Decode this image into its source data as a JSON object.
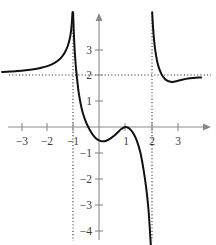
{
  "figure": {
    "title": "",
    "background_color": "#ffffff",
    "curve_color": "#111111",
    "axis_color": "#8a8a8a",
    "asymptote_color": "#2a2a2a",
    "label_color": "#3b3b3b"
  },
  "chart_data": {
    "type": "line",
    "title": "",
    "xlabel": "",
    "ylabel": "",
    "xlim": [
      -3.7,
      3.9
    ],
    "ylim": [
      -4.6,
      4.4
    ],
    "grid": false,
    "legend": null,
    "x_ticks": [
      -3,
      -2,
      -1,
      1,
      2,
      3
    ],
    "x_tick_labels": [
      "−3",
      "−2",
      "−1",
      "1",
      "2",
      "3"
    ],
    "y_ticks": [
      3,
      2,
      1,
      -1,
      -2,
      -3,
      -4
    ],
    "y_tick_labels": [
      "3",
      "2",
      "1",
      "−1",
      "−2",
      "−3",
      "−4"
    ],
    "asymptotes": {
      "vertical": [
        -1,
        2
      ],
      "horizontal": [
        2
      ]
    },
    "features": {
      "local_min_middle_branch": [
        0.15,
        -0.55
      ],
      "local_max_middle_branch": [
        1,
        0
      ],
      "local_min_right_branch": [
        2.75,
        1.75
      ],
      "x_intercept_tangent": [
        1,
        0
      ]
    },
    "series": [
      {
        "name": "left-branch",
        "comment": "x from -3.7 to -1, approaches y=2 from above at -inf, rises to +inf at x=-1",
        "points": [
          [
            -3.7,
            2.13
          ],
          [
            -3.4,
            2.15
          ],
          [
            -3.1,
            2.17
          ],
          [
            -2.8,
            2.2
          ],
          [
            -2.5,
            2.24
          ],
          [
            -2.2,
            2.3
          ],
          [
            -2.0,
            2.35
          ],
          [
            -1.8,
            2.43
          ],
          [
            -1.6,
            2.55
          ],
          [
            -1.45,
            2.68
          ],
          [
            -1.3,
            2.9
          ],
          [
            -1.2,
            3.12
          ],
          [
            -1.12,
            3.4
          ],
          [
            -1.07,
            3.7
          ],
          [
            -1.04,
            4.0
          ],
          [
            -1.02,
            4.3
          ],
          [
            -1.01,
            4.45
          ]
        ]
      },
      {
        "name": "middle-branch",
        "comment": "x from -1 to 2, falls from +inf at x=-1+, local min near (0.15,-0.55), touches 0 at x=1, falls to -inf at x=2-",
        "points": [
          [
            -0.99,
            4.45
          ],
          [
            -0.97,
            3.9
          ],
          [
            -0.95,
            3.4
          ],
          [
            -0.92,
            2.85
          ],
          [
            -0.88,
            2.3
          ],
          [
            -0.83,
            1.8
          ],
          [
            -0.77,
            1.3
          ],
          [
            -0.7,
            0.9
          ],
          [
            -0.62,
            0.55
          ],
          [
            -0.52,
            0.25
          ],
          [
            -0.42,
            0.02
          ],
          [
            -0.3,
            -0.2
          ],
          [
            -0.18,
            -0.37
          ],
          [
            -0.05,
            -0.49
          ],
          [
            0.1,
            -0.55
          ],
          [
            0.25,
            -0.54
          ],
          [
            0.4,
            -0.47
          ],
          [
            0.55,
            -0.36
          ],
          [
            0.7,
            -0.22
          ],
          [
            0.85,
            -0.08
          ],
          [
            1.0,
            0.0
          ],
          [
            1.1,
            -0.02
          ],
          [
            1.2,
            -0.1
          ],
          [
            1.32,
            -0.26
          ],
          [
            1.45,
            -0.55
          ],
          [
            1.58,
            -1.0
          ],
          [
            1.7,
            -1.65
          ],
          [
            1.8,
            -2.35
          ],
          [
            1.88,
            -3.1
          ],
          [
            1.93,
            -3.8
          ],
          [
            1.96,
            -4.3
          ],
          [
            1.98,
            -4.6
          ]
        ]
      },
      {
        "name": "right-branch",
        "comment": "x from 2 to 3.9, falls from +inf at x=2+, local min near (2.75,1.75), rises back toward y=2",
        "points": [
          [
            2.03,
            4.45
          ],
          [
            2.06,
            3.9
          ],
          [
            2.1,
            3.4
          ],
          [
            2.15,
            2.95
          ],
          [
            2.22,
            2.55
          ],
          [
            2.3,
            2.25
          ],
          [
            2.4,
            2.02
          ],
          [
            2.5,
            1.88
          ],
          [
            2.62,
            1.79
          ],
          [
            2.75,
            1.75
          ],
          [
            2.88,
            1.76
          ],
          [
            3.0,
            1.79
          ],
          [
            3.2,
            1.84
          ],
          [
            3.4,
            1.88
          ],
          [
            3.6,
            1.9
          ],
          [
            3.9,
            1.92
          ]
        ]
      }
    ]
  }
}
